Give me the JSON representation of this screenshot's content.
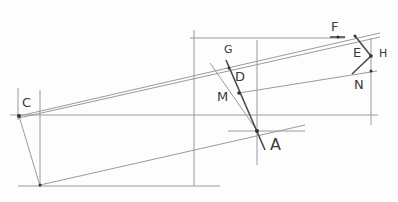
{
  "diagram": {
    "stroke_color": "#8a8a8a",
    "dark_stroke_color": "#4a4a4a",
    "labels": [
      {
        "id": "C",
        "text": "C",
        "x": 22,
        "y": 98
      },
      {
        "id": "F",
        "text": "F",
        "x": 330,
        "y": 20
      },
      {
        "id": "G",
        "text": "G",
        "x": 224,
        "y": 45
      },
      {
        "id": "D",
        "text": "D",
        "x": 235,
        "y": 70
      },
      {
        "id": "M",
        "text": "M",
        "x": 217,
        "y": 90
      },
      {
        "id": "A",
        "text": "A",
        "x": 269,
        "y": 137
      },
      {
        "id": "E",
        "text": "E",
        "x": 353,
        "y": 47
      },
      {
        "id": "H",
        "text": "H",
        "x": 378,
        "y": 48
      },
      {
        "id": "N",
        "text": "N",
        "x": 354,
        "y": 78
      }
    ],
    "points": {
      "C": [
        19,
        116
      ],
      "A": [
        257,
        131
      ],
      "M": [
        239,
        93
      ],
      "D": [
        231,
        77
      ],
      "G": [
        228,
        68
      ],
      "F": [
        338,
        37
      ],
      "E": [
        355,
        36
      ],
      "H": [
        371,
        56
      ],
      "N": [
        352,
        74
      ],
      "B": [
        40,
        185
      ]
    }
  }
}
